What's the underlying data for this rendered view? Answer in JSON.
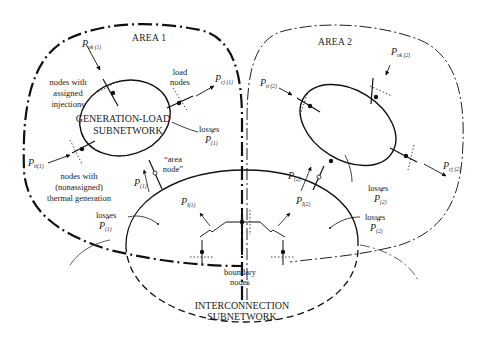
{
  "areas": [
    {
      "id": "area1",
      "label": "AREA 1"
    },
    {
      "id": "area2",
      "label": "AREA 2"
    }
  ],
  "subnetworks": {
    "generation_load": {
      "line1": "GENERATION-LOAD",
      "line2": "SUBNETWORK"
    },
    "interconnection": {
      "line1": "INTERCONNECTION",
      "line2": "SUBNETWORK"
    }
  },
  "annotations": {
    "assigned_injections": [
      "nodes with",
      "assigned",
      "injections"
    ],
    "load_nodes": [
      "load",
      "nodes"
    ],
    "thermal_generation": [
      "nodes with",
      "(nonassigned)",
      "thermal generation"
    ],
    "area_node": [
      "“area",
      "node”"
    ],
    "boundary_nodes": [
      "boundary",
      "nodes"
    ],
    "losses1_prime": {
      "word": "losses",
      "sym": "P",
      "mark": "′",
      "sub": "(1)"
    },
    "losses1_dprime": {
      "word": "losses",
      "sym": "P",
      "mark": "″",
      "sub": "(1)"
    },
    "losses2_prime": {
      "word": "losses",
      "sym": "P",
      "mark": "′",
      "sub": "(2)"
    },
    "losses2_dprime": {
      "word": "losses",
      "sym": "P",
      "mark": "″",
      "sub": "(2)"
    }
  },
  "symbols": {
    "P_ok1": {
      "base": "P",
      "sub": "ok (1)"
    },
    "P_cj1": {
      "base": "P",
      "sub": "cj (1)"
    },
    "P_tt1": {
      "base": "P",
      "sub": "tt(1)"
    },
    "P_1": {
      "base": "P",
      "sub": "(1)"
    },
    "P_I1": {
      "base": "P",
      "sub": "I(1)"
    },
    "P_I2": {
      "base": "P",
      "sub": "I(2)"
    },
    "P_2": {
      "base": "P",
      "sub": "(2)"
    },
    "P_tt2": {
      "base": "P",
      "sub": "tt (2)"
    },
    "P_ok2": {
      "base": "P",
      "sub": "ok (2)"
    },
    "P_cj2": {
      "base": "P",
      "sub": "cj (2)"
    }
  }
}
